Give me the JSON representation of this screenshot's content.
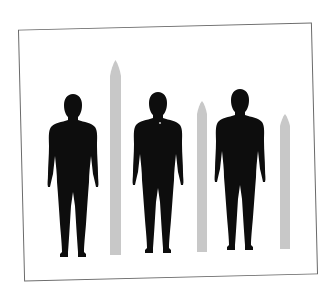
{
  "scene": {
    "description": "Three black human silhouettes standing side by side, each followed by a tall light-gray pointed pole of decreasing height, inside a slightly tilted rectangular frame",
    "background_color": "#ffffff",
    "frame_color": "#6a6a6a",
    "silhouette_color": "#0d0d0d",
    "pole_color": "#c8c8c8"
  },
  "figures": [
    {
      "name": "silhouette-1",
      "head_top_y": 94,
      "center_x": 73,
      "feet_y": 256
    },
    {
      "name": "silhouette-2",
      "head_top_y": 92,
      "center_x": 158,
      "feet_y": 253
    },
    {
      "name": "silhouette-3",
      "head_top_y": 89,
      "center_x": 240,
      "feet_y": 250
    }
  ],
  "poles": [
    {
      "name": "pole-1",
      "left_x": 110,
      "width": 11,
      "top_y": 60,
      "bottom_y": 255
    },
    {
      "name": "pole-2",
      "left_x": 197,
      "width": 10,
      "top_y": 101,
      "bottom_y": 252
    },
    {
      "name": "pole-3",
      "left_x": 280,
      "width": 10,
      "top_y": 114,
      "bottom_y": 249
    }
  ]
}
